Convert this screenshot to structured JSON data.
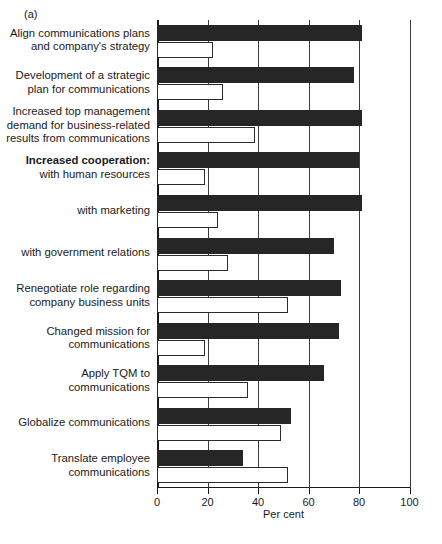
{
  "panel_tag": "(a)",
  "chart_data": {
    "type": "bar",
    "orientation": "horizontal",
    "title": "",
    "xlabel": "Per cent",
    "ylabel": "",
    "xlim": [
      0,
      100
    ],
    "xticks": [
      0,
      20,
      40,
      60,
      80,
      100
    ],
    "xtick_labels": [
      "0",
      "20",
      "40",
      "60",
      "80",
      "100"
    ],
    "grid": "vertical",
    "legend": "none",
    "series": [
      {
        "name": "dark",
        "style": "filled-black",
        "values": [
          81,
          78,
          81,
          80,
          81,
          70,
          73,
          72,
          66,
          53,
          34
        ]
      },
      {
        "name": "light",
        "style": "open-white",
        "values": [
          22,
          26,
          39,
          19,
          24,
          28,
          52,
          19,
          36,
          49,
          52
        ]
      }
    ],
    "categories": [
      "Align communications plans and company's strategy",
      "Development of a strategic plan for communications",
      "Increased top management demand for business-related results from communications",
      "Increased cooperation: with human resources",
      "with marketing",
      "with government relations",
      "Renegotiate role regarding company business units",
      "Changed mission for communications",
      "Apply TQM to communications",
      "Globalize communications",
      "Translate employee communications"
    ],
    "category_lines": [
      [
        "Align communications plans",
        "and company's strategy"
      ],
      [
        "Development of a strategic",
        "plan for communications"
      ],
      [
        "Increased top management",
        "demand for business-related",
        "results from communications"
      ],
      [
        "Increased cooperation:",
        "with human resources"
      ],
      [
        "with marketing"
      ],
      [
        "with government relations"
      ],
      [
        "Renegotiate role regarding",
        "company business units"
      ],
      [
        "Changed mission for",
        "communications"
      ],
      [
        "Apply TQM to",
        "communications"
      ],
      [
        "Globalize communications"
      ],
      [
        "Translate employee",
        "communications"
      ]
    ],
    "colors": {
      "dark_bar": "#262626",
      "light_bar": "#ffffff",
      "bar_outline": "#2b2b2b",
      "axis": "#1a1a1a",
      "grid": "#3b3b3b"
    }
  }
}
